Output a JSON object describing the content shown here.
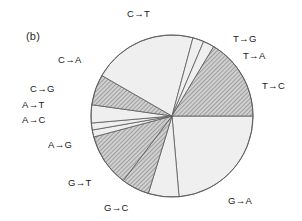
{
  "figure": {
    "panel_label": "(b)",
    "arrow_glyph": "→"
  },
  "chart_data": {
    "type": "pie",
    "title": "",
    "xlabel": "",
    "ylabel": "",
    "legend_position": "outside-labels",
    "grid": false,
    "start_angle_deg": 0,
    "direction": "clockwise",
    "center": [
      172,
      116
    ],
    "radius": 81,
    "categories": [
      "G→A",
      "G→C",
      "G→T",
      "A→G",
      "A→C",
      "A→T",
      "C→G",
      "C→A",
      "C→T",
      "T→G",
      "T→A",
      "T→C"
    ],
    "values": [
      85,
      22,
      20,
      38,
      5,
      5,
      13,
      22,
      75,
      8,
      8,
      40
    ],
    "units": "degrees",
    "slices": [
      {
        "label": "G→A",
        "start_deg": 0,
        "end_deg": 85,
        "fill": "light",
        "hatch": false
      },
      {
        "label": "G→C",
        "start_deg": 85,
        "end_deg": 107,
        "fill": "light",
        "hatch": false
      },
      {
        "label": "G→T",
        "start_deg": 107,
        "end_deg": 127,
        "fill": "dark",
        "hatch": true
      },
      {
        "label": "A→G",
        "start_deg": 127,
        "end_deg": 165,
        "fill": "dark",
        "hatch": true
      },
      {
        "label": "A→C",
        "start_deg": 165,
        "end_deg": 170,
        "fill": "light",
        "hatch": false
      },
      {
        "label": "A→T",
        "start_deg": 170,
        "end_deg": 175,
        "fill": "light",
        "hatch": false
      },
      {
        "label": "C→G",
        "start_deg": 175,
        "end_deg": 188,
        "fill": "light",
        "hatch": false
      },
      {
        "label": "C→A",
        "start_deg": 188,
        "end_deg": 210,
        "fill": "dark",
        "hatch": true
      },
      {
        "label": "C→T",
        "start_deg": 210,
        "end_deg": 285,
        "fill": "light",
        "hatch": false
      },
      {
        "label": "T→G",
        "start_deg": 285,
        "end_deg": 293,
        "fill": "light",
        "hatch": false
      },
      {
        "label": "T→A",
        "start_deg": 293,
        "end_deg": 301,
        "fill": "light",
        "hatch": false
      },
      {
        "label": "T→C",
        "start_deg": 301,
        "end_deg": 360,
        "fill": "dark",
        "hatch": true
      }
    ],
    "colors": {
      "light_fill": "#efefef",
      "dark_fill": "#a8a8a8",
      "outline": "#5a5a5a",
      "text": "#1a1a1a"
    }
  },
  "labels": {
    "c_to_t": {
      "text": "C→T",
      "left": 127,
      "top": 8
    },
    "t_to_g": {
      "text": "T→G",
      "left": 233,
      "top": 33
    },
    "t_to_a": {
      "text": "T→A",
      "left": 243,
      "top": 50
    },
    "t_to_c": {
      "text": "T→C",
      "left": 262,
      "top": 80
    },
    "g_to_a": {
      "text": "G→A",
      "left": 228,
      "top": 195
    },
    "g_to_c": {
      "text": "G→C",
      "left": 104,
      "top": 202
    },
    "g_to_t": {
      "text": "G→T",
      "left": 68,
      "top": 177
    },
    "a_to_g": {
      "text": "A→G",
      "left": 48,
      "top": 139
    },
    "a_to_c": {
      "text": "A→C",
      "left": 22,
      "top": 114
    },
    "a_to_t": {
      "text": "A→T",
      "left": 22,
      "top": 99
    },
    "c_to_g": {
      "text": "C→G",
      "left": 30,
      "top": 83
    },
    "c_to_a": {
      "text": "C→A",
      "left": 58,
      "top": 54
    }
  }
}
